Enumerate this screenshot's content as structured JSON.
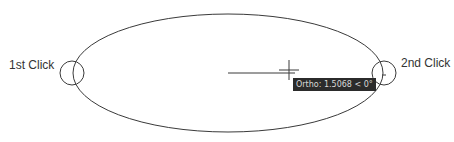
{
  "labels": {
    "first_click": "1st Click",
    "second_click": "2nd Click"
  },
  "tooltip": {
    "text": "Ortho: 1.5068 < 0°"
  },
  "colors": {
    "stroke": "#3a3a3a",
    "tooltip_bg": "#2b2b2b",
    "tooltip_text": "#d8d8d8"
  }
}
